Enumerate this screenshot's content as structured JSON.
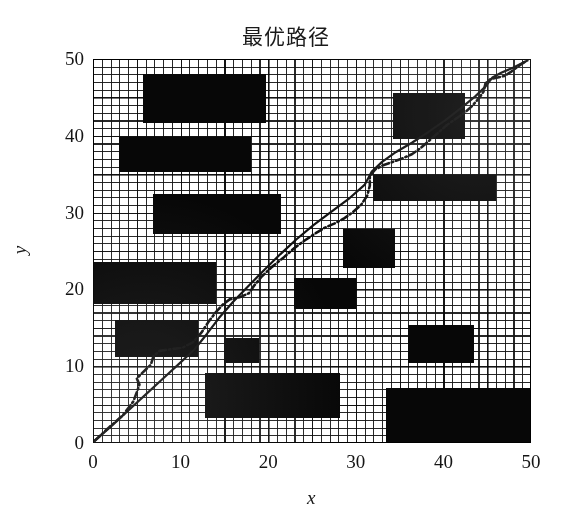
{
  "chart_data": {
    "type": "scatter",
    "title": "最优路径",
    "xlabel": "x",
    "ylabel": "y",
    "xlim": [
      0,
      50
    ],
    "ylim": [
      0,
      50
    ],
    "xticks": [
      0,
      10,
      20,
      30,
      40,
      50
    ],
    "yticks": [
      0,
      10,
      20,
      30,
      40,
      50
    ],
    "xtick_labels": [
      "0",
      "10",
      "20",
      "30",
      "40",
      "50"
    ],
    "ytick_labels": [
      "0",
      "10",
      "20",
      "30",
      "40",
      "50"
    ],
    "grid": true,
    "grid_minor_step": 1,
    "grid_major_step": 5,
    "legend": "none",
    "background": "#ffffff",
    "obstacle_color": "#070707",
    "path_color": "#101010",
    "obstacles": [
      {
        "name": "obstacle-1",
        "x0": 5.7,
        "y0": 41.6,
        "x1": 19.7,
        "y1": 48.1
      },
      {
        "name": "obstacle-2",
        "x0": 3.0,
        "y0": 35.3,
        "x1": 18.0,
        "y1": 39.8
      },
      {
        "name": "obstacle-3",
        "x0": 6.9,
        "y0": 27.2,
        "x1": 21.5,
        "y1": 32.4
      },
      {
        "name": "obstacle-4",
        "x0": 0.0,
        "y0": 18.1,
        "x1": 14.0,
        "y1": 23.6
      },
      {
        "name": "obstacle-5",
        "x0": 2.5,
        "y0": 11.2,
        "x1": 12.0,
        "y1": 16.0
      },
      {
        "name": "obstacle-6",
        "x0": 15.0,
        "y0": 10.4,
        "x1": 19.0,
        "y1": 13.7
      },
      {
        "name": "obstacle-7",
        "x0": 12.8,
        "y0": 3.3,
        "x1": 28.2,
        "y1": 9.1
      },
      {
        "name": "obstacle-8",
        "x0": 33.4,
        "y0": 0.0,
        "x1": 50.0,
        "y1": 7.2
      },
      {
        "name": "obstacle-9",
        "x0": 36.0,
        "y0": 10.4,
        "x1": 43.5,
        "y1": 15.4
      },
      {
        "name": "obstacle-10",
        "x0": 23.0,
        "y0": 17.4,
        "x1": 30.0,
        "y1": 21.5
      },
      {
        "name": "obstacle-11",
        "x0": 28.5,
        "y0": 22.8,
        "x1": 34.5,
        "y1": 27.8
      },
      {
        "name": "obstacle-12",
        "x0": 32.0,
        "y0": 31.5,
        "x1": 46.0,
        "y1": 34.9
      },
      {
        "name": "obstacle-13",
        "x0": 34.3,
        "y0": 39.6,
        "x1": 42.5,
        "y1": 45.6
      }
    ],
    "series": [
      {
        "name": "optimal-path-smooth",
        "style": "solid",
        "points": [
          [
            0.2,
            0.3
          ],
          [
            2.0,
            2.1
          ],
          [
            4.0,
            4.2
          ],
          [
            6.0,
            6.3
          ],
          [
            8.0,
            8.4
          ],
          [
            10.0,
            10.5
          ],
          [
            11.6,
            12.2
          ],
          [
            13.0,
            14.2
          ],
          [
            14.4,
            16.3
          ],
          [
            16.0,
            18.4
          ],
          [
            17.8,
            20.5
          ],
          [
            19.6,
            22.6
          ],
          [
            21.4,
            24.6
          ],
          [
            23.2,
            26.5
          ],
          [
            25.2,
            28.4
          ],
          [
            27.3,
            30.2
          ],
          [
            29.3,
            31.9
          ],
          [
            31.0,
            33.6
          ],
          [
            31.8,
            35.3
          ],
          [
            33.0,
            36.6
          ],
          [
            34.6,
            37.9
          ],
          [
            36.4,
            39.1
          ],
          [
            38.3,
            40.5
          ],
          [
            40.2,
            42.0
          ],
          [
            42.0,
            43.6
          ],
          [
            43.6,
            45.1
          ],
          [
            44.8,
            46.4
          ],
          [
            45.6,
            47.6
          ],
          [
            46.6,
            48.2
          ],
          [
            48.0,
            48.9
          ],
          [
            49.6,
            49.8
          ]
        ]
      },
      {
        "name": "optimal-path-raw",
        "style": "dash-dot",
        "points": [
          [
            0.2,
            0.3
          ],
          [
            1.8,
            2.0
          ],
          [
            3.4,
            3.6
          ],
          [
            4.6,
            5.4
          ],
          [
            5.0,
            6.6
          ],
          [
            5.3,
            7.6
          ],
          [
            5.0,
            8.4
          ],
          [
            5.6,
            9.1
          ],
          [
            6.6,
            10.2
          ],
          [
            6.9,
            11.3
          ],
          [
            7.6,
            12.0
          ],
          [
            8.8,
            12.2
          ],
          [
            10.2,
            12.4
          ],
          [
            11.4,
            13.1
          ],
          [
            12.4,
            14.4
          ],
          [
            13.2,
            15.8
          ],
          [
            14.0,
            17.0
          ],
          [
            14.8,
            18.0
          ],
          [
            15.6,
            18.7
          ],
          [
            16.8,
            19.0
          ],
          [
            17.8,
            19.5
          ],
          [
            18.4,
            20.5
          ],
          [
            19.2,
            21.6
          ],
          [
            20.4,
            22.9
          ],
          [
            21.8,
            24.2
          ],
          [
            23.0,
            25.4
          ],
          [
            24.2,
            26.4
          ],
          [
            25.4,
            27.3
          ],
          [
            26.4,
            28.0
          ],
          [
            27.6,
            28.6
          ],
          [
            28.6,
            29.2
          ],
          [
            29.6,
            30.0
          ],
          [
            30.6,
            31.0
          ],
          [
            31.3,
            32.2
          ],
          [
            31.6,
            33.5
          ],
          [
            31.6,
            34.8
          ],
          [
            32.2,
            35.6
          ],
          [
            33.2,
            36.2
          ],
          [
            34.2,
            36.6
          ],
          [
            35.2,
            37.0
          ],
          [
            36.4,
            37.6
          ],
          [
            37.4,
            38.4
          ],
          [
            38.4,
            39.4
          ],
          [
            39.4,
            40.4
          ],
          [
            40.4,
            41.4
          ],
          [
            41.4,
            42.2
          ],
          [
            42.4,
            43.0
          ],
          [
            43.2,
            43.8
          ],
          [
            44.0,
            44.8
          ],
          [
            44.6,
            45.8
          ],
          [
            44.8,
            46.8
          ],
          [
            45.4,
            47.4
          ],
          [
            46.2,
            47.6
          ],
          [
            47.0,
            47.8
          ],
          [
            47.8,
            48.4
          ],
          [
            48.6,
            49.1
          ],
          [
            49.4,
            49.7
          ]
        ]
      }
    ]
  }
}
